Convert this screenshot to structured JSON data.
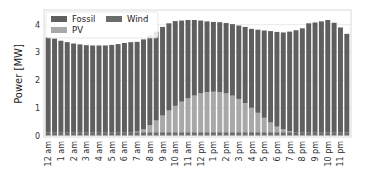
{
  "chart_data": {
    "type": "bar",
    "stacked": true,
    "title": "",
    "xlabel": "",
    "ylabel": "Power [MW]",
    "ylim": [
      0,
      4.4
    ],
    "yticks": [
      0,
      1,
      2,
      3,
      4
    ],
    "grid": true,
    "legend_position": "upper left",
    "legend": [
      "Fossil",
      "Wind",
      "PV"
    ],
    "x_tick_labels": [
      "12 am",
      "1 am",
      "2 am",
      "3 am",
      "4 am",
      "5 am",
      "6 am",
      "7 am",
      "8 am",
      "9 am",
      "10 am",
      "11 am",
      "12 pm",
      "1 pm",
      "2 pm",
      "3 pm",
      "4 pm",
      "5 pm",
      "6 pm",
      "7 pm",
      "8 pm",
      "9 pm",
      "10 pm",
      "11 pm"
    ],
    "bars_per_hour": 2,
    "colors": {
      "Fossil": "#5f5f5f",
      "Wind": "#6c6c6c",
      "PV": "#a8a8a8"
    },
    "series": [
      {
        "name": "Wind",
        "values": [
          0.12,
          0.12,
          0.12,
          0.12,
          0.12,
          0.12,
          0.12,
          0.12,
          0.12,
          0.12,
          0.12,
          0.12,
          0.12,
          0.12,
          0.12,
          0.12,
          0.12,
          0.12,
          0.12,
          0.12,
          0.12,
          0.12,
          0.12,
          0.12,
          0.12,
          0.12,
          0.12,
          0.12,
          0.12,
          0.12,
          0.12,
          0.12,
          0.12,
          0.12,
          0.12,
          0.12,
          0.12,
          0.12,
          0.12,
          0.12,
          0.12,
          0.12,
          0.12,
          0.12,
          0.12,
          0.12,
          0.12,
          0.12
        ]
      },
      {
        "name": "PV",
        "values": [
          0,
          0,
          0,
          0,
          0,
          0,
          0,
          0,
          0,
          0,
          0,
          0,
          0,
          0,
          0.02,
          0.1,
          0.25,
          0.42,
          0.6,
          0.78,
          0.95,
          1.1,
          1.22,
          1.32,
          1.4,
          1.45,
          1.46,
          1.45,
          1.4,
          1.32,
          1.2,
          1.05,
          0.88,
          0.7,
          0.52,
          0.35,
          0.2,
          0.1,
          0.03,
          0,
          0,
          0,
          0,
          0,
          0,
          0,
          0,
          0
        ]
      },
      {
        "name": "Fossil",
        "values": [
          3.43,
          3.38,
          3.3,
          3.25,
          3.2,
          3.17,
          3.14,
          3.13,
          3.13,
          3.13,
          3.15,
          3.18,
          3.22,
          3.25,
          3.24,
          3.25,
          3.23,
          3.21,
          3.2,
          3.15,
          3.06,
          2.93,
          2.83,
          2.73,
          2.63,
          2.55,
          2.52,
          2.52,
          2.54,
          2.58,
          2.65,
          2.75,
          2.85,
          3.0,
          3.15,
          3.3,
          3.42,
          3.5,
          3.6,
          3.68,
          3.75,
          3.93,
          3.96,
          4.0,
          4.05,
          3.95,
          3.78,
          3.55
        ]
      }
    ],
    "totals": [
      3.55,
      3.5,
      3.42,
      3.37,
      3.32,
      3.29,
      3.26,
      3.25,
      3.25,
      3.25,
      3.27,
      3.3,
      3.34,
      3.37,
      3.38,
      3.47,
      3.6,
      3.75,
      3.92,
      4.05,
      4.13,
      4.15,
      4.17,
      4.17,
      4.15,
      4.12,
      4.1,
      4.09,
      4.06,
      4.02,
      3.97,
      3.92,
      3.85,
      3.82,
      3.79,
      3.77,
      3.74,
      3.72,
      3.75,
      3.8,
      3.87,
      4.05,
      4.08,
      4.12,
      4.17,
      4.07,
      3.9,
      3.67
    ]
  }
}
